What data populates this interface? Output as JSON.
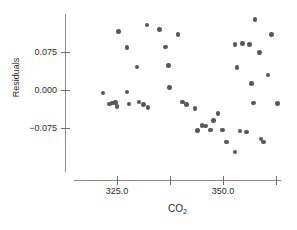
{
  "chart_data": {
    "type": "scatter",
    "title": "",
    "subtitle": "",
    "xlabel": "CO2",
    "xlabel_display": "CO",
    "xlabel_subscript": "2",
    "ylabel": "Residuals",
    "xlim": [
      318.0,
      364.5
    ],
    "ylim": [
      -0.135,
      0.115
    ],
    "xticks": [
      325.0,
      337.5,
      350.0,
      362.5
    ],
    "xtick_labels": [
      "",
      "325.0",
      "",
      "350.0",
      ""
    ],
    "xtick_labels_shown": [
      "325.0",
      "350.0"
    ],
    "yticks": [
      0.075,
      0.0,
      -0.075
    ],
    "ytick_labels": [
      "0.075",
      "0.000",
      "−0.075"
    ],
    "grid": false,
    "legend": null,
    "marker_color": "#585858",
    "axis_color": "#8a8a8a",
    "text_color": "#2b2b2b",
    "background_color": "#ffffff",
    "marker_size": 4.6,
    "points": [
      {
        "x": 321.7,
        "y": -0.006
      },
      {
        "x": 323.3,
        "y": -0.028
      },
      {
        "x": 324.0,
        "y": -0.026
      },
      {
        "x": 324.6,
        "y": -0.025
      },
      {
        "x": 325.0,
        "y": -0.032
      },
      {
        "x": 325.4,
        "y": 0.116
      },
      {
        "x": 327.4,
        "y": 0.084
      },
      {
        "x": 327.4,
        "y": -0.004
      },
      {
        "x": 327.8,
        "y": -0.028
      },
      {
        "x": 329.7,
        "y": 0.045
      },
      {
        "x": 330.2,
        "y": -0.024
      },
      {
        "x": 331.3,
        "y": -0.029
      },
      {
        "x": 332.1,
        "y": 0.128
      },
      {
        "x": 332.3,
        "y": -0.035
      },
      {
        "x": 335.0,
        "y": 0.119
      },
      {
        "x": 336.4,
        "y": 0.085
      },
      {
        "x": 337.2,
        "y": 0.048
      },
      {
        "x": 337.4,
        "y": 0.005
      },
      {
        "x": 339.4,
        "y": 0.11
      },
      {
        "x": 340.4,
        "y": -0.024
      },
      {
        "x": 341.4,
        "y": -0.029
      },
      {
        "x": 343.4,
        "y": -0.036
      },
      {
        "x": 344.0,
        "y": -0.08
      },
      {
        "x": 345.0,
        "y": -0.07
      },
      {
        "x": 345.9,
        "y": -0.071
      },
      {
        "x": 347.0,
        "y": -0.079
      },
      {
        "x": 347.8,
        "y": -0.06
      },
      {
        "x": 348.8,
        "y": -0.046
      },
      {
        "x": 349.9,
        "y": -0.079
      },
      {
        "x": 350.8,
        "y": -0.103
      },
      {
        "x": 352.8,
        "y": -0.122
      },
      {
        "x": 352.8,
        "y": 0.09
      },
      {
        "x": 353.3,
        "y": 0.044
      },
      {
        "x": 354.0,
        "y": -0.081
      },
      {
        "x": 354.6,
        "y": 0.092
      },
      {
        "x": 355.5,
        "y": -0.083
      },
      {
        "x": 356.2,
        "y": 0.09
      },
      {
        "x": 356.7,
        "y": 0.013
      },
      {
        "x": 357.2,
        "y": -0.026
      },
      {
        "x": 357.5,
        "y": 0.139
      },
      {
        "x": 358.6,
        "y": 0.074
      },
      {
        "x": 359.0,
        "y": -0.097
      },
      {
        "x": 359.5,
        "y": -0.103
      },
      {
        "x": 360.6,
        "y": 0.03
      },
      {
        "x": 361.4,
        "y": 0.11
      },
      {
        "x": 362.9,
        "y": -0.027
      }
    ]
  },
  "plot_geometry": {
    "x_pixel_at_325": 117,
    "x_pixels_per_unit": 4.24,
    "y_pixel_at_0": 90,
    "y_pixels_per_0075": 38,
    "axis_left": 65,
    "axis_bottom": 180
  }
}
